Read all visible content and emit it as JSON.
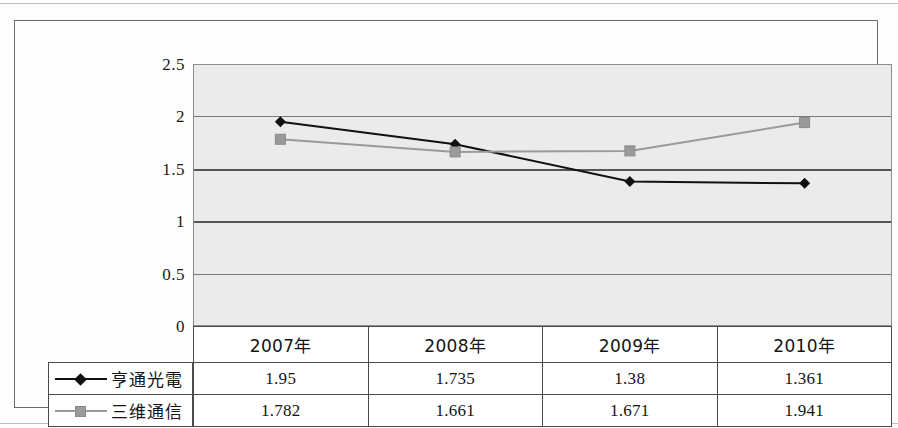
{
  "chart_data": {
    "type": "line",
    "title": "",
    "xlabel": "",
    "ylabel": "",
    "categories": [
      "2007年",
      "2008年",
      "2009年",
      "2010年"
    ],
    "series": [
      {
        "name": "亨通光電",
        "marker": "diamond",
        "color": "#111111",
        "values": [
          1.95,
          1.735,
          1.38,
          1.361
        ],
        "labels": [
          "1.95",
          "1.735",
          "1.38",
          "1.361"
        ]
      },
      {
        "name": "三维通信",
        "marker": "square",
        "color": "#9a9a9a",
        "values": [
          1.782,
          1.661,
          1.671,
          1.941
        ],
        "labels": [
          "1.782",
          "1.661",
          "1.671",
          "1.941"
        ]
      }
    ],
    "ylim": [
      0,
      2.5
    ],
    "yticks": [
      0,
      0.5,
      1,
      1.5,
      2,
      2.5
    ],
    "ytick_labels": [
      "0",
      "0.5",
      "1",
      "1.5",
      "2",
      "2.5"
    ],
    "grid": true,
    "legend_position": "table-left",
    "plot_background": "#ebebeb",
    "gridline_color": "#7a7a7a",
    "frame_color": "#6b6b6b"
  },
  "table": {
    "categories": [
      "2007年",
      "2008年",
      "2009年",
      "2010年"
    ],
    "rows": [
      {
        "label": "亨通光電",
        "values": [
          "1.95",
          "1.735",
          "1.38",
          "1.361"
        ]
      },
      {
        "label": "三维通信",
        "values": [
          "1.782",
          "1.661",
          "1.671",
          "1.941"
        ]
      }
    ]
  }
}
